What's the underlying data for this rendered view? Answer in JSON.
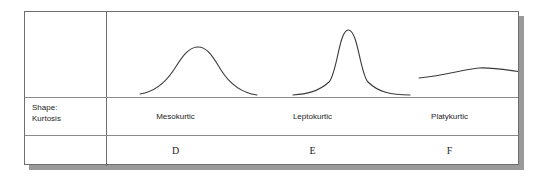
{
  "figure": {
    "row_label": {
      "line1": "Shape:",
      "line2": "Kurtosis"
    },
    "columns": [
      {
        "shape": "Mesokurtic",
        "letter": "D",
        "curve": "mesokurtic-curve"
      },
      {
        "shape": "Leptokurtic",
        "letter": "E",
        "curve": "leptokurtic-curve"
      },
      {
        "shape": "Platykurtic",
        "letter": "F",
        "curve": "platykurtic-curve"
      }
    ],
    "colors": {
      "border": "#6e6e6e",
      "inner_rule": "#8a8a8a",
      "curve_stroke": "#3a3a3a",
      "text": "#242424",
      "shadow": "#9a9a9a",
      "background": "#ffffff"
    }
  },
  "chart_data": {
    "type": "line",
    "title": "Shape: Kurtosis",
    "xlabel": "",
    "ylabel": "",
    "grid": false,
    "legend_position": "none",
    "axis_visible": false,
    "series": [
      {
        "name": "Mesokurtic",
        "label": "D",
        "peak_height_px": 46,
        "baseline_px": 93,
        "x_start_px": 115,
        "x_end_px": 262,
        "peak_x_px": 187,
        "path": "M 33,82 C 45,80 56,74 66,59 C 74,47 80,36 90,35 C 100,34 106,45 114,58 C 124,74 136,81 150,83"
      },
      {
        "name": "Leptokurtic",
        "label": "E",
        "peak_height_px": 28,
        "baseline_px": 84,
        "x_start_px": 268,
        "x_end_px": 385,
        "peak_x_px": 322,
        "path": "M 186,83 C 199,82 211,80 222,70 C 230,62 232,19 241,18 C 251,17 253,62 261,70 C 271,80 284,83 303,83"
      },
      {
        "name": "Platykurtic",
        "label": "F",
        "peak_height_px": 68,
        "baseline_px": 75,
        "x_start_px": 394,
        "x_end_px": 518,
        "peak_x_px": 453,
        "path": "M 312,66 C 340,63 358,57 372,56 C 390,55 410,60 436,63"
      }
    ]
  }
}
